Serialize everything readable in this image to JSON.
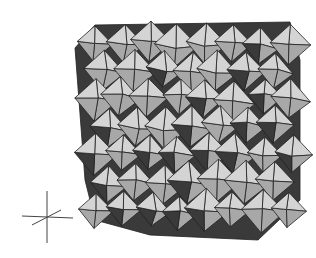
{
  "figure": {
    "colors": {
      "light": "#d4d4d4",
      "mid": "#a8a8a8",
      "dark": "#3a3a3a",
      "edge": "#222222",
      "background": "#ffffff"
    },
    "axes_indicator": {
      "present": true
    }
  }
}
